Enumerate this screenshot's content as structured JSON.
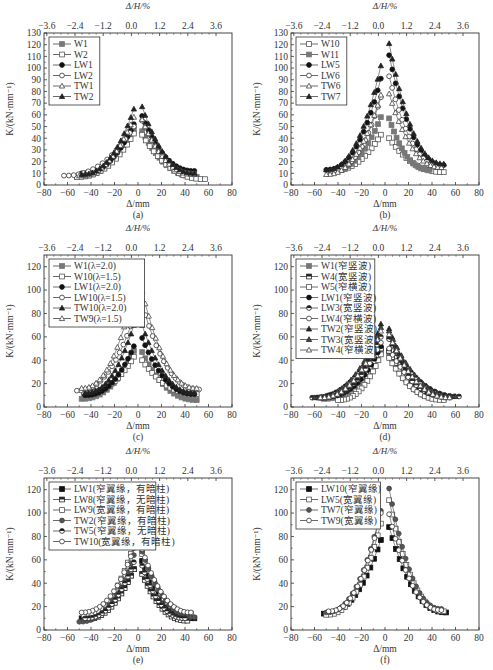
{
  "figure": {
    "top_axis_label": "Δ/H/%",
    "bottom_axis_label": "Δ/mm",
    "y_axis_label": "K/(kN·mm⁻¹)"
  },
  "chart_data": [
    {
      "id": "a",
      "caption": "(a)",
      "type": "scatter",
      "xlabel": "Δ/mm",
      "x2label": "Δ/H/%",
      "ylabel": "K/(kN·mm⁻¹)",
      "xlim": [
        -80,
        80
      ],
      "ylim": [
        0,
        130
      ],
      "xticks": [
        -80,
        -60,
        -40,
        -20,
        0,
        20,
        40,
        60,
        80
      ],
      "x2ticks": [
        "-3.6",
        "-2.4",
        "-1.2",
        "0.0",
        "1.2",
        "2.4",
        "3.6"
      ],
      "yticks": [
        0,
        10,
        20,
        30,
        40,
        50,
        60,
        70,
        80,
        90,
        100,
        110,
        120,
        130
      ],
      "legend_position": "upper-left",
      "series": [
        {
          "name": "W1",
          "marker": "square-filled-gray",
          "peak_neg": 48,
          "peak_pos": 46,
          "x_min": -52,
          "x_max": 50,
          "k_end_neg": 7,
          "k_end_pos": 7
        },
        {
          "name": "W2",
          "marker": "square-open",
          "peak_neg": 44,
          "peak_pos": 43,
          "x_min": -52,
          "x_max": 57,
          "k_end_neg": 7,
          "k_end_pos": 5
        },
        {
          "name": "LW1",
          "marker": "circle-filled",
          "peak_neg": 52,
          "peak_pos": 59,
          "x_min": -48,
          "x_max": 48,
          "k_end_neg": 10,
          "k_end_pos": 12
        },
        {
          "name": "LW2",
          "marker": "circle-open",
          "peak_neg": 50,
          "peak_pos": 55,
          "x_min": -63,
          "x_max": 48,
          "k_end_neg": 8,
          "k_end_pos": 10
        },
        {
          "name": "TW1",
          "marker": "triangle-open",
          "peak_neg": 58,
          "peak_pos": 56,
          "x_min": -50,
          "x_max": 48,
          "k_end_neg": 8,
          "k_end_pos": 9
        },
        {
          "name": "TW2",
          "marker": "triangle-filled",
          "peak_neg": 65,
          "peak_pos": 67,
          "x_min": -48,
          "x_max": 48,
          "k_end_neg": 9,
          "k_end_pos": 10
        }
      ]
    },
    {
      "id": "b",
      "caption": "(b)",
      "type": "scatter",
      "xlabel": "Δ/mm",
      "x2label": "Δ/H/%",
      "ylabel": "K/(kN·mm⁻¹)",
      "xlim": [
        -80,
        80
      ],
      "ylim": [
        0,
        130
      ],
      "xticks": [
        -80,
        -60,
        -40,
        -20,
        0,
        20,
        40,
        60,
        80
      ],
      "x2ticks": [
        "-3.6",
        "-2.4",
        "-1.2",
        "0.0",
        "1.2",
        "2.4",
        "3.6"
      ],
      "yticks": [
        0,
        10,
        20,
        30,
        40,
        50,
        60,
        70,
        80,
        90,
        100,
        110,
        120,
        130
      ],
      "legend_position": "upper-left",
      "series": [
        {
          "name": "W10",
          "marker": "square-open",
          "peak_neg": 43,
          "peak_pos": 40,
          "x_min": -46,
          "x_max": 50,
          "k_end_neg": 12,
          "k_end_pos": 11
        },
        {
          "name": "W11",
          "marker": "square-filled-gray",
          "peak_neg": 58,
          "peak_pos": 57,
          "x_min": -46,
          "x_max": 38,
          "k_end_neg": 12,
          "k_end_pos": 13
        },
        {
          "name": "LW5",
          "marker": "circle-filled",
          "peak_neg": 91,
          "peak_pos": 111,
          "x_min": -50,
          "x_max": 50,
          "k_end_neg": 13,
          "k_end_pos": 17
        },
        {
          "name": "LW6",
          "marker": "circle-open",
          "peak_neg": 75,
          "peak_pos": 93,
          "x_min": -46,
          "x_max": 48,
          "k_end_neg": 12,
          "k_end_pos": 16
        },
        {
          "name": "TW6",
          "marker": "triangle-open",
          "peak_neg": 77,
          "peak_pos": 78,
          "x_min": -50,
          "x_max": 48,
          "k_end_neg": 9,
          "k_end_pos": 15
        },
        {
          "name": "TW7",
          "marker": "triangle-filled",
          "peak_neg": 102,
          "peak_pos": 121,
          "x_min": -50,
          "x_max": 50,
          "k_end_neg": 13,
          "k_end_pos": 18
        }
      ]
    },
    {
      "id": "c",
      "caption": "(c)",
      "type": "scatter",
      "xlabel": "Δ/mm",
      "x2label": "Δ/H/%",
      "ylabel": "K/(kN·mm⁻¹)",
      "xlim": [
        -80,
        80
      ],
      "ylim": [
        0,
        130
      ],
      "xticks": [
        -80,
        -60,
        -40,
        -20,
        0,
        20,
        40,
        60,
        80
      ],
      "x2ticks": [
        "-3.6",
        "-2.4",
        "-1.2",
        "0.0",
        "1.2",
        "2.4",
        "3.6"
      ],
      "yticks": [
        0,
        20,
        40,
        60,
        80,
        100,
        120
      ],
      "legend_position": "upper-left",
      "series": [
        {
          "name": "W1(λ=2.0)",
          "marker": "square-filled-gray",
          "peak_neg": 48,
          "peak_pos": 47,
          "x_min": -48,
          "x_max": 50,
          "k_end_neg": 7,
          "k_end_pos": 6
        },
        {
          "name": "W10(λ=1.5)",
          "marker": "square-open",
          "peak_neg": 43,
          "peak_pos": 40,
          "x_min": -46,
          "x_max": 50,
          "k_end_neg": 12,
          "k_end_pos": 11
        },
        {
          "name": "LW1(λ=2.0)",
          "marker": "circle-filled",
          "peak_neg": 52,
          "peak_pos": 59,
          "x_min": -45,
          "x_max": 48,
          "k_end_neg": 10,
          "k_end_pos": 11
        },
        {
          "name": "LW10(λ=1.5)",
          "marker": "circle-open",
          "peak_neg": 77,
          "peak_pos": 88,
          "x_min": -52,
          "x_max": 52,
          "k_end_neg": 14,
          "k_end_pos": 15
        },
        {
          "name": "TW10(λ=2.0)",
          "marker": "triangle-filled",
          "peak_neg": 70,
          "peak_pos": 70,
          "x_min": -45,
          "x_max": 48,
          "k_end_neg": 12,
          "k_end_pos": 12
        },
        {
          "name": "TW9(λ=1.5)",
          "marker": "triangle-open",
          "peak_neg": 100,
          "peak_pos": 99,
          "x_min": -48,
          "x_max": 50,
          "k_end_neg": 16,
          "k_end_pos": 16
        }
      ]
    },
    {
      "id": "d",
      "caption": "(d)",
      "type": "scatter",
      "xlabel": "Δ/mm",
      "x2label": "Δ/H/%",
      "ylabel": "K/(kN·mm⁻¹)",
      "xlim": [
        -80,
        80
      ],
      "ylim": [
        0,
        130
      ],
      "xticks": [
        -80,
        -60,
        -40,
        -20,
        0,
        20,
        40,
        60,
        80
      ],
      "x2ticks": [
        "-3.6",
        "-2.4",
        "-1.2",
        "0.0",
        "1.2",
        "2.4",
        "3.6"
      ],
      "yticks": [
        0,
        20,
        40,
        60,
        80,
        100,
        120
      ],
      "legend_position": "upper-left",
      "series": [
        {
          "name": "W1(窄竖波)",
          "marker": "square-filled-gray",
          "peak_neg": 48,
          "peak_pos": 46,
          "x_min": -52,
          "x_max": 50,
          "k_end_neg": 7,
          "k_end_pos": 7
        },
        {
          "name": "W4(宽竖波)",
          "marker": "square-half",
          "peak_neg": 50,
          "peak_pos": 48,
          "x_min": -55,
          "x_max": 48,
          "k_end_neg": 8,
          "k_end_pos": 7
        },
        {
          "name": "W5(窄横波)",
          "marker": "square-open",
          "peak_neg": 45,
          "peak_pos": 42,
          "x_min": -40,
          "x_max": 50,
          "k_end_neg": 6,
          "k_end_pos": 6
        },
        {
          "name": "LW1(窄竖波)",
          "marker": "circle-filled",
          "peak_neg": 52,
          "peak_pos": 59,
          "x_min": -48,
          "x_max": 48,
          "k_end_neg": 10,
          "k_end_pos": 10
        },
        {
          "name": "LW3(宽竖波)",
          "marker": "circle-half",
          "peak_neg": 60,
          "peak_pos": 58,
          "x_min": -62,
          "x_max": 63,
          "k_end_neg": 8,
          "k_end_pos": 9
        },
        {
          "name": "LW4(窄横波)",
          "marker": "circle-open",
          "peak_neg": 55,
          "peak_pos": 50,
          "x_min": -55,
          "x_max": 55,
          "k_end_neg": 8,
          "k_end_pos": 8
        },
        {
          "name": "TW2(窄竖波)",
          "marker": "triangle-filled",
          "peak_neg": 71,
          "peak_pos": 67,
          "x_min": -48,
          "x_max": 48,
          "k_end_neg": 9,
          "k_end_pos": 10
        },
        {
          "name": "TW3(宽竖波)",
          "marker": "triangle-half",
          "peak_neg": 68,
          "peak_pos": 65,
          "x_min": -60,
          "x_max": 60,
          "k_end_neg": 8,
          "k_end_pos": 9
        },
        {
          "name": "TW4(窄横波)",
          "marker": "triangle-open",
          "peak_neg": 65,
          "peak_pos": 62,
          "x_min": -55,
          "x_max": 55,
          "k_end_neg": 8,
          "k_end_pos": 8
        }
      ]
    },
    {
      "id": "e",
      "caption": "(e)",
      "type": "scatter",
      "xlabel": "Δ/mm",
      "x2label": "Δ/H/%",
      "ylabel": "K/(kN·mm⁻¹)",
      "xlim": [
        -80,
        80
      ],
      "ylim": [
        0,
        130
      ],
      "xticks": [
        -80,
        -60,
        -40,
        -20,
        0,
        20,
        40,
        60,
        80
      ],
      "x2ticks": [
        "-3.6",
        "-2.4",
        "-1.2",
        "0.0",
        "1.2",
        "2.4",
        "3.6"
      ],
      "yticks": [
        0,
        20,
        40,
        60,
        80,
        100,
        120
      ],
      "legend_position": "upper-left",
      "series": [
        {
          "name": "LW1(窄翼缘，有暗柱)",
          "marker": "square-filled",
          "peak_neg": 52,
          "peak_pos": 59,
          "x_min": -48,
          "x_max": 48,
          "k_end_neg": 10,
          "k_end_pos": 10
        },
        {
          "name": "LW8(窄翼缘，无暗柱)",
          "marker": "square-half",
          "peak_neg": 52,
          "peak_pos": 48,
          "x_min": -46,
          "x_max": 42,
          "k_end_neg": 9,
          "k_end_pos": 8
        },
        {
          "name": "LW9(宽翼缘，有暗柱)",
          "marker": "square-open",
          "peak_neg": 73,
          "peak_pos": 65,
          "x_min": -46,
          "x_max": 45,
          "k_end_neg": 13,
          "k_end_pos": 14
        },
        {
          "name": "TW2(窄翼缘，有暗柱)",
          "marker": "circle-filled-gray",
          "peak_neg": 64,
          "peak_pos": 67,
          "x_min": -50,
          "x_max": 48,
          "k_end_neg": 7,
          "k_end_pos": 11
        },
        {
          "name": "TW5(窄翼缘，无暗柱)",
          "marker": "circle-half",
          "peak_neg": 58,
          "peak_pos": 55,
          "x_min": -45,
          "x_max": 40,
          "k_end_neg": 10,
          "k_end_pos": 10
        },
        {
          "name": "TW10(宽翼缘，有暗柱)",
          "marker": "circle-open",
          "peak_neg": 70,
          "peak_pos": 69,
          "x_min": -48,
          "x_max": 45,
          "k_end_neg": 15,
          "k_end_pos": 15
        }
      ]
    },
    {
      "id": "f",
      "caption": "(f)",
      "type": "scatter",
      "xlabel": "Δ/mm",
      "x2label": "Δ/H/%",
      "ylabel": "K/(kN·mm⁻¹)",
      "xlim": [
        -80,
        80
      ],
      "ylim": [
        0,
        130
      ],
      "xticks": [
        -80,
        -60,
        -40,
        -20,
        0,
        20,
        40,
        60,
        80
      ],
      "x2ticks": [
        "-3.6",
        "-2.4",
        "-1.2",
        "0.0",
        "1.2",
        "2.4",
        "3.6"
      ],
      "yticks": [
        0,
        20,
        40,
        60,
        80,
        100,
        120
      ],
      "legend_position": "upper-left",
      "series": [
        {
          "name": "LW10(窄翼缘)",
          "marker": "square-filled",
          "peak_neg": 77,
          "peak_pos": 88,
          "x_min": -52,
          "x_max": 52,
          "k_end_neg": 14,
          "k_end_pos": 15
        },
        {
          "name": "LW5(宽翼缘)",
          "marker": "square-open",
          "peak_neg": 91,
          "peak_pos": 111,
          "x_min": -50,
          "x_max": 50,
          "k_end_neg": 13,
          "k_end_pos": 16
        },
        {
          "name": "TW7(窄翼缘)",
          "marker": "circle-filled-gray",
          "peak_neg": 102,
          "peak_pos": 121,
          "x_min": -50,
          "x_max": 48,
          "k_end_neg": 15,
          "k_end_pos": 18
        },
        {
          "name": "TW9(宽翼缘)",
          "marker": "circle-open",
          "peak_neg": 100,
          "peak_pos": 99,
          "x_min": -48,
          "x_max": 48,
          "k_end_neg": 16,
          "k_end_pos": 17
        }
      ]
    }
  ],
  "layout": {
    "panels": [
      {
        "id": "a",
        "left": 0,
        "top": 0
      },
      {
        "id": "b",
        "left": 247,
        "top": 0
      },
      {
        "id": "c",
        "left": 0,
        "top": 222
      },
      {
        "id": "d",
        "left": 247,
        "top": 222
      },
      {
        "id": "e",
        "left": 0,
        "top": 445
      },
      {
        "id": "f",
        "left": 247,
        "top": 445
      }
    ]
  }
}
